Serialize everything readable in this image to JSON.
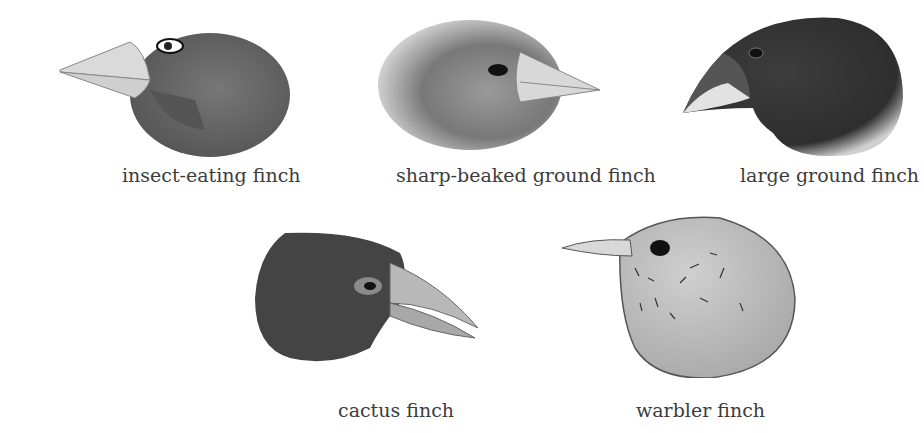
{
  "figure": {
    "type": "illustration",
    "colors": {
      "background": "#ffffff",
      "label_text": "#3c3c3c",
      "dark_plumage": "#3a3a3a",
      "mid_plumage": "#6e6e6e",
      "light_plumage": "#bdbdbd",
      "beak": "#d4d4d4"
    }
  },
  "birds": [
    {
      "id": "insect-eating",
      "label": "insect-eating finch"
    },
    {
      "id": "sharp-beaked-ground",
      "label": "sharp-beaked ground finch"
    },
    {
      "id": "large-ground",
      "label": "large ground finch"
    },
    {
      "id": "cactus",
      "label": "cactus finch"
    },
    {
      "id": "warbler",
      "label": "warbler finch"
    }
  ]
}
